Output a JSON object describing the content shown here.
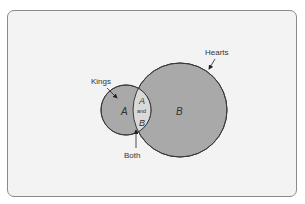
{
  "diagram": {
    "type": "venn",
    "colors": {
      "card_bg": "#f3f3f3",
      "circle_fill": "#a9a9a9",
      "intersection_fill": "#d9d9d9",
      "stroke": "#3a3a3a"
    },
    "sets": [
      {
        "id": "A",
        "label": "Kings",
        "region_letter": "A"
      },
      {
        "id": "B",
        "label": "Hearts",
        "region_letter": "B"
      }
    ],
    "intersection": {
      "label": "Both",
      "text_top": "A",
      "text_mid": "and",
      "text_bottom": "B"
    }
  }
}
